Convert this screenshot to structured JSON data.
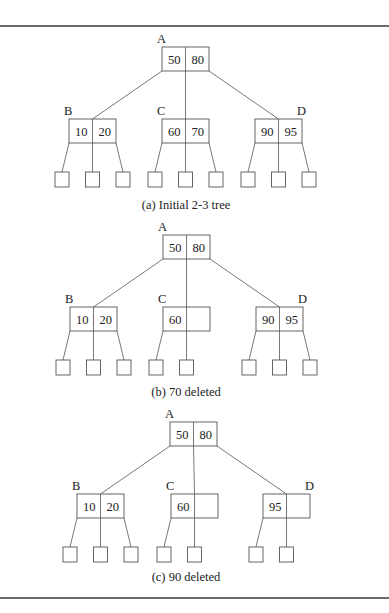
{
  "figure": {
    "width": 389,
    "height": 613,
    "rules": {
      "top_y": 26,
      "bottom_y": 598,
      "x1": 0,
      "x2": 389
    },
    "node_size": {
      "w": 47,
      "h": 24
    },
    "leaf_size": {
      "w": 14,
      "h": 15
    },
    "panels": [
      {
        "id": "a",
        "caption": "(a) Initial 2-3 tree",
        "caption_x": 186,
        "caption_y": 209,
        "nodes": [
          {
            "label": "A",
            "keys": [
              "50",
              "80"
            ],
            "x": 162,
            "y": 47,
            "label_dx": -5,
            "label_side": "left",
            "children": [
              "B",
              "C",
              "D"
            ]
          },
          {
            "label": "B",
            "keys": [
              "10",
              "20"
            ],
            "x": 69,
            "y": 119,
            "label_side": "left",
            "leaves": 3
          },
          {
            "label": "C",
            "keys": [
              "60",
              "70"
            ],
            "x": 162,
            "y": 119,
            "label_side": "left",
            "leaves": 3
          },
          {
            "label": "D",
            "keys": [
              "90",
              "95"
            ],
            "x": 255,
            "y": 119,
            "label_side": "right",
            "leaves": 3
          }
        ],
        "leaf_y": 172
      },
      {
        "id": "b",
        "caption": "(b) 70 deleted",
        "caption_x": 186,
        "caption_y": 396,
        "nodes": [
          {
            "label": "A",
            "keys": [
              "50",
              "80"
            ],
            "x": 163,
            "y": 235,
            "label_side": "left",
            "children": [
              "B",
              "C",
              "D"
            ]
          },
          {
            "label": "B",
            "keys": [
              "10",
              "20"
            ],
            "x": 70,
            "y": 307,
            "label_side": "left",
            "leaves": 3
          },
          {
            "label": "C",
            "keys": [
              "60",
              ""
            ],
            "x": 163,
            "y": 307,
            "label_side": "left",
            "leaves": 2
          },
          {
            "label": "D",
            "keys": [
              "90",
              "95"
            ],
            "x": 256,
            "y": 307,
            "label_side": "right",
            "leaves": 3
          }
        ],
        "leaf_y": 360
      },
      {
        "id": "c",
        "caption": "(c) 90 deleted",
        "caption_x": 186,
        "caption_y": 581,
        "nodes": [
          {
            "label": "A",
            "keys": [
              "50",
              "80"
            ],
            "x": 170,
            "y": 422,
            "label_side": "left",
            "children": [
              "B",
              "C",
              "D"
            ]
          },
          {
            "label": "B",
            "keys": [
              "10",
              "20"
            ],
            "x": 77,
            "y": 494,
            "label_side": "left",
            "leaves": 3
          },
          {
            "label": "C",
            "keys": [
              "60",
              ""
            ],
            "x": 171,
            "y": 494,
            "label_side": "left",
            "leaves": 2
          },
          {
            "label": "D",
            "keys": [
              "95",
              ""
            ],
            "x": 263,
            "y": 494,
            "label_side": "right",
            "leaves": 2
          }
        ],
        "leaf_y": 547
      }
    ]
  }
}
